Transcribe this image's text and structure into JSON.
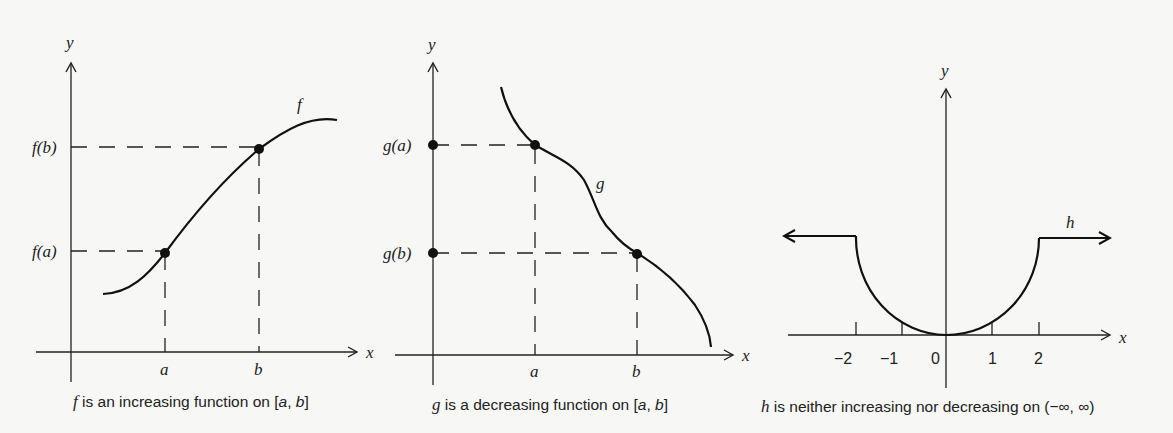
{
  "panels": [
    {
      "id": "f",
      "function_label": "f",
      "axis_x_label": "x",
      "axis_y_label": "y",
      "x_ticks": [
        "a",
        "b"
      ],
      "y_ticks": [
        "f(a)",
        "f(b)"
      ],
      "caption_var": "f",
      "caption_text": " is an increasing function on [",
      "caption_a": "a",
      "caption_sep": ", ",
      "caption_b": "b",
      "caption_end": "]"
    },
    {
      "id": "g",
      "function_label": "g",
      "axis_x_label": "x",
      "axis_y_label": "y",
      "x_ticks": [
        "a",
        "b"
      ],
      "y_ticks": [
        "g(a)",
        "g(b)"
      ],
      "caption_var": "g",
      "caption_text": " is a decreasing function on [",
      "caption_a": "a",
      "caption_sep": ", ",
      "caption_b": "b",
      "caption_end": "]"
    },
    {
      "id": "h",
      "function_label": "h",
      "axis_x_label": "x",
      "axis_y_label": "y",
      "x_ticks": [
        "−2",
        "−1",
        "0",
        "1",
        "2"
      ],
      "caption_var": "h",
      "caption_text": " is neither increasing nor decreasing on (−∞, ∞)"
    }
  ],
  "colors": {
    "ink": "#222222",
    "paper": "#f7f7f5"
  }
}
